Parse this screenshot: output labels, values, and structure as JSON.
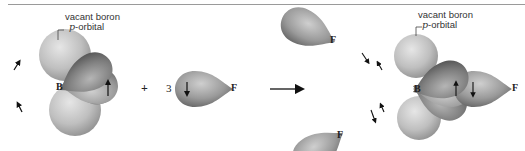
{
  "figure": {
    "type": "orbital-diagram"
  },
  "reactant": {
    "label_line1": "vacant boron",
    "label_p": "p",
    "label_line2_rest": "-orbital",
    "central_atom": "B"
  },
  "operator_plus": "+",
  "fluorine": {
    "coefficient": "3",
    "atom": "F"
  },
  "reaction_arrow": "→",
  "product": {
    "label_line1": "vacant boron",
    "label_p": "p",
    "label_line2_rest": "-orbital",
    "central_atom": "B",
    "fluorines": [
      "F",
      "F",
      "F"
    ]
  },
  "colors": {
    "hybrid_lobe_dark": "#6e6e6e",
    "hybrid_lobe_light": "#bdbdbd",
    "p_orbital_light": "#d4d4d4",
    "p_orbital_mid": "#a8a8a8",
    "rule_line": "#9a9a9a"
  }
}
